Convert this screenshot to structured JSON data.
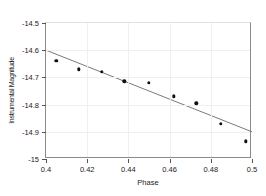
{
  "chart_data": {
    "type": "scatter",
    "title": "",
    "xlabel": "Phase",
    "ylabel": "Instrumental Magnitude",
    "xlim": [
      0.4,
      0.5
    ],
    "ylim": [
      -15.0,
      -14.5
    ],
    "y_axis_inverted": false,
    "grid": true,
    "legend": null,
    "x_ticks": [
      0.4,
      0.42,
      0.44,
      0.46,
      0.48,
      0.5
    ],
    "x_tick_labels": [
      "0.4",
      "0.42",
      "0.44",
      "0.46",
      "0.48",
      "0.5"
    ],
    "y_ticks": [
      -14.5,
      -14.6,
      -14.7,
      -14.8,
      -14.9,
      -15.0
    ],
    "y_tick_labels": [
      "-14.5",
      "-14.6",
      "-14.7",
      "-14.8",
      "-14.9",
      "-15"
    ],
    "series": [
      {
        "name": "observations",
        "type": "scatter",
        "marker": "circle",
        "color": "#101010",
        "x": [
          0.405,
          0.416,
          0.427,
          0.438,
          0.45,
          0.462,
          0.473,
          0.485,
          0.497
        ],
        "y": [
          -14.64,
          -14.67,
          -14.68,
          -14.715,
          -14.72,
          -14.77,
          -14.795,
          -14.87,
          -14.935
        ]
      },
      {
        "name": "linear-fit",
        "type": "line",
        "color": "#7a7a7a",
        "x": [
          0.4,
          0.5
        ],
        "y": [
          -14.6,
          -14.9
        ]
      }
    ]
  }
}
